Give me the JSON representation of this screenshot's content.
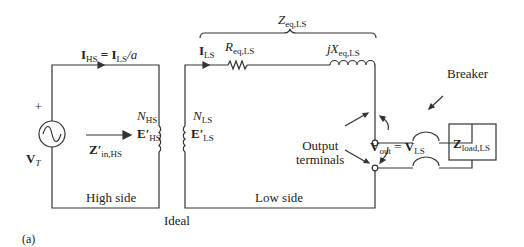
{
  "figure": {
    "panel_label": "(a)",
    "high_side": {
      "current_label_main": "I",
      "current_label_sub": "HS",
      "current_eq": " = ",
      "current_rhs_main": "I",
      "current_rhs_sub": "LS",
      "current_rhs_tail": "/a",
      "source_plus": "+",
      "source_label_main": "V",
      "source_label_sub": "T",
      "impedance_label_main": "Z′",
      "impedance_label_sub": "in,HS",
      "turns_main": "N",
      "turns_sub": "HS",
      "emf_main": "E′",
      "emf_sub": "HS",
      "side_label": "High side"
    },
    "transformer": {
      "label": "Ideal"
    },
    "low_side": {
      "current_main": "I",
      "current_sub": "LS",
      "resistor_main": "R",
      "resistor_sub": "eq,LS",
      "reactance_main": "jX",
      "reactance_sub": "eq,LS",
      "zeq_main": "Z",
      "zeq_sub": "eq,LS",
      "turns_main": "N",
      "turns_sub": "LS",
      "emf_main": "E′",
      "emf_sub": "LS",
      "side_label": "Low side",
      "output_terminals": [
        "Output",
        "terminals"
      ],
      "vout_main": "V",
      "vout_sub": "out",
      "vout_eq": " = ",
      "vls_main": "V",
      "vls_sub": "LS",
      "breaker_label": "Breaker",
      "load_main": "Z",
      "load_sub": "load,LS"
    },
    "colors": {
      "line": "#333333",
      "background": "#ffffff"
    }
  }
}
